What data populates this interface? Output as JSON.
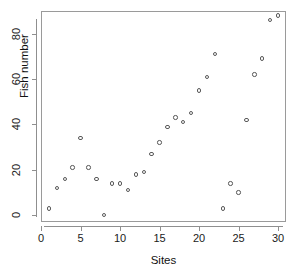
{
  "figure": {
    "background": "#ffffff",
    "point_color": "#585858",
    "axis_color": "#8f8f8f",
    "text_color": "#1a1a1a"
  },
  "chart_data": {
    "type": "scatter",
    "title": "",
    "xlabel": "Sites",
    "ylabel": "Fish number",
    "xlim": [
      0,
      31
    ],
    "ylim": [
      -3,
      90
    ],
    "grid": false,
    "legend": null,
    "marker": "open-circle",
    "xticks": [
      0,
      5,
      10,
      15,
      20,
      25,
      30
    ],
    "xtick_labels": [
      "0",
      "5",
      "10",
      "15",
      "20",
      "25",
      "30"
    ],
    "yticks": [
      0,
      20,
      40,
      60,
      80
    ],
    "ytick_labels": [
      "0",
      "20",
      "40",
      "60",
      "80"
    ],
    "x": [
      1,
      2,
      3,
      4,
      5,
      6,
      7,
      8,
      9,
      10,
      11,
      12,
      13,
      14,
      15,
      16,
      17,
      18,
      19,
      20,
      21,
      22,
      23,
      24,
      25,
      26,
      27,
      28,
      29,
      30
    ],
    "y": [
      3,
      12,
      16,
      21,
      34,
      21,
      16,
      0,
      14,
      14,
      11,
      18,
      19,
      27,
      32,
      39,
      43,
      41,
      45,
      55,
      61,
      71,
      3,
      14,
      10,
      42,
      62,
      69,
      86,
      88
    ],
    "points": [
      {
        "x": 1,
        "y": 3
      },
      {
        "x": 2,
        "y": 12
      },
      {
        "x": 3,
        "y": 16
      },
      {
        "x": 4,
        "y": 21
      },
      {
        "x": 5,
        "y": 34
      },
      {
        "x": 6,
        "y": 21
      },
      {
        "x": 7,
        "y": 16
      },
      {
        "x": 8,
        "y": 0
      },
      {
        "x": 9,
        "y": 14
      },
      {
        "x": 10,
        "y": 14
      },
      {
        "x": 11,
        "y": 11
      },
      {
        "x": 12,
        "y": 18
      },
      {
        "x": 13,
        "y": 19
      },
      {
        "x": 14,
        "y": 27
      },
      {
        "x": 15,
        "y": 32
      },
      {
        "x": 16,
        "y": 39
      },
      {
        "x": 17,
        "y": 43
      },
      {
        "x": 18,
        "y": 41
      },
      {
        "x": 19,
        "y": 45
      },
      {
        "x": 20,
        "y": 55
      },
      {
        "x": 21,
        "y": 61
      },
      {
        "x": 22,
        "y": 71
      },
      {
        "x": 23,
        "y": 3
      },
      {
        "x": 24,
        "y": 14
      },
      {
        "x": 25,
        "y": 10
      },
      {
        "x": 26,
        "y": 42
      },
      {
        "x": 27,
        "y": 62
      },
      {
        "x": 28,
        "y": 69
      },
      {
        "x": 29,
        "y": 86
      },
      {
        "x": 30,
        "y": 88
      }
    ]
  }
}
